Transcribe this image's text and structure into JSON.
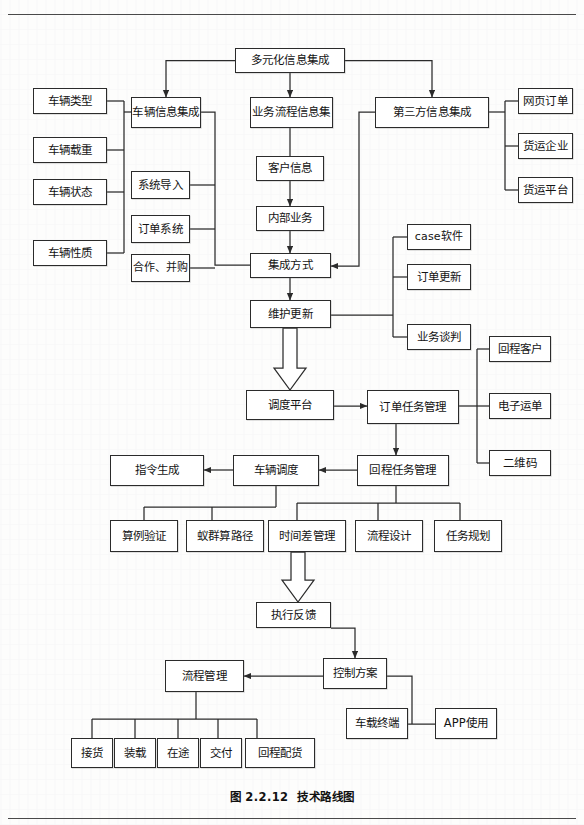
{
  "figure": {
    "caption_number": "图 2.2.12",
    "caption_title": "技术路线图",
    "domain": "flowchart",
    "ink_color": "#2b2b2b",
    "paper_color": "#fdfdfc"
  },
  "nodes": {
    "root": "多元化信息集成",
    "vehicle_info_integration": "车辆信息集成",
    "business_process_info": "业务流程信息集",
    "third_party_info": "第三方信息集成",
    "vehicle_type": "车辆类型",
    "vehicle_load": "车辆载重",
    "vehicle_status": "车辆状态",
    "vehicle_nature": "车辆性质",
    "system_import": "系统导入",
    "order_system": "订单系统",
    "cooperation_merger": "合作、并购",
    "customer_info": "客户信息",
    "internal_business": "内部业务",
    "integration_method": "集成方式",
    "maintenance_update": "维护更新",
    "web_order": "网页订单",
    "freight_enterprise": "货运企业",
    "freight_platform": "货运平台",
    "case_software": "case软件",
    "order_update": "订单更新",
    "business_negotiation": "业务谈判",
    "dispatch_platform": "调度平台",
    "order_task_management": "订单任务管理",
    "return_customer": "回程客户",
    "electronic_waybill": "电子运单",
    "qr_code": "二维码",
    "instruction_generation": "指令生成",
    "vehicle_dispatch": "车辆调度",
    "return_task_management": "回程任务管理",
    "case_verification": "算例验证",
    "ant_colony_route": "蚁群算路径",
    "time_difference_management": "时间差管理",
    "process_design": "流程设计",
    "task_planning": "任务规划",
    "execution_feedback": "执行反馈",
    "control_scheme": "控制方案",
    "process_management": "流程管理",
    "vehicle_terminal": "车载终端",
    "app_usage": "APP使用",
    "pickup": "接货",
    "loading": "装载",
    "in_transit": "在途",
    "delivery": "交付",
    "return_distribution": "回程配货"
  }
}
